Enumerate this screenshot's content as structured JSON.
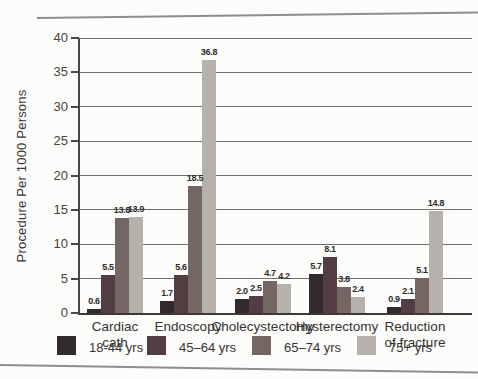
{
  "figure": {
    "background": "#fcfcfa"
  },
  "chart_data": {
    "type": "bar",
    "title": "",
    "xlabel": "",
    "ylabel": "Procedure Per 1000 Persons",
    "ylim": [
      0,
      40
    ],
    "yticks": [
      0,
      5,
      10,
      15,
      20,
      25,
      30,
      35,
      40
    ],
    "grid": true,
    "legend_position": "bottom",
    "categories": [
      "Cardiac cath",
      "Endoscopy",
      "Cholecystectomy",
      "Hysterectomy",
      "Reduction of fracture"
    ],
    "category_label_lines": [
      [
        "Cardiac",
        "cath"
      ],
      [
        "Endoscopy"
      ],
      [
        "Cholecystectomy"
      ],
      [
        "Hysterectomy"
      ],
      [
        "Reduction",
        "of fracture"
      ]
    ],
    "series": [
      {
        "name": "18-44 yrs",
        "color": "#332a2c",
        "values": [
          0.6,
          1.7,
          2.0,
          5.7,
          0.9
        ]
      },
      {
        "name": "45–64 yrs",
        "color": "#523e42",
        "values": [
          5.5,
          5.6,
          2.5,
          8.1,
          2.1
        ]
      },
      {
        "name": "65–74 yrs",
        "color": "#746763",
        "values": [
          13.8,
          18.5,
          4.7,
          3.8,
          5.1
        ]
      },
      {
        "name": "75+ yrs",
        "color": "#b6b2ab",
        "values": [
          13.9,
          36.8,
          4.2,
          2.4,
          14.8
        ]
      }
    ]
  }
}
